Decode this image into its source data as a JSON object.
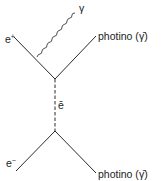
{
  "diagram": {
    "type": "feynman-diagram",
    "particles": {
      "positron": {
        "symbol": "e",
        "superscript": "+"
      },
      "electron": {
        "symbol": "e",
        "superscript": "−"
      },
      "photon": {
        "label": "γ"
      },
      "selectron": {
        "label": "ē"
      },
      "photino_top": {
        "label": "photino (",
        "symbol": "γ̄",
        "close": ")"
      },
      "photino_bottom": {
        "label": "photino (",
        "symbol": "γ̄",
        "close": ")"
      }
    },
    "colors": {
      "line": "#2a2a2a",
      "text": "#222222",
      "background": "#ffffff"
    }
  }
}
